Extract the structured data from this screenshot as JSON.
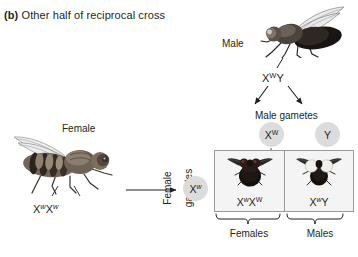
{
  "figure": {
    "panel_letter": "(b)",
    "panel_title": "Other half of reciprocal cross",
    "type": "genetics-cross-diagram",
    "organism": "fruit fly"
  },
  "parents": {
    "male": {
      "label": "Male",
      "genotype_base": "X",
      "genotype_sup1": "W",
      "genotype_rest": "Y",
      "genotype_text": "XWY",
      "eye_color": "white",
      "art_name": "male-fly-illustration"
    },
    "female": {
      "label": "Female",
      "genotype_text": "XwXw",
      "genotype_base": "X",
      "genotype_sup1": "w",
      "genotype_mid": "X",
      "genotype_sup2": "w",
      "eye_color": "red",
      "art_name": "female-fly-illustration"
    }
  },
  "gametes": {
    "male_label": "Male gametes",
    "female_label": "Female\ngametes",
    "female_label_line1": "Female",
    "female_label_line2": "gametes",
    "male_items": [
      {
        "base": "X",
        "sup": "W",
        "sup_italic": false,
        "name": "gamete-x-w"
      },
      {
        "base": "Y",
        "sup": "",
        "sup_italic": false,
        "name": "gamete-y"
      }
    ],
    "female_items": [
      {
        "base": "X",
        "sup": "w",
        "sup_italic": true,
        "name": "gamete-x-w-female"
      }
    ]
  },
  "punnett": {
    "cells": [
      {
        "genotype_text": "XwXW",
        "base1": "X",
        "sup1": "w",
        "sup1_italic": true,
        "base2": "X",
        "sup2": "W",
        "sup2_italic": false,
        "offspring_sex": "Females",
        "eye_color": "red",
        "fly_name": "offspring-fly-red-eyed"
      },
      {
        "genotype_text": "XwY",
        "base1": "X",
        "sup1": "w",
        "sup1_italic": true,
        "base2": "Y",
        "sup2": "",
        "sup2_italic": false,
        "offspring_sex": "Males",
        "eye_color": "white",
        "fly_name": "offspring-fly-white-eyed"
      }
    ],
    "captions": [
      "Females",
      "Males"
    ]
  },
  "colors": {
    "gamete_circle": "#dcdcdc",
    "punnett_fill": "#f4f4f4",
    "punnett_border": "#9a9a9a",
    "text": "#231f20",
    "fly_dark": "#2b2522",
    "fly_eye_red": "#3a2420",
    "fly_eye_white": "#f2f0ec"
  }
}
